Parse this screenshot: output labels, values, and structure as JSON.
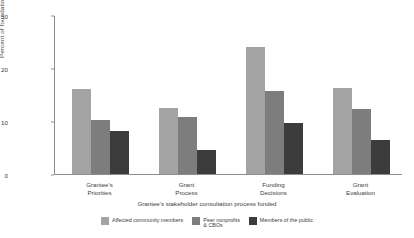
{
  "chart_data": {
    "type": "bar",
    "title": "",
    "subtitle": "",
    "xlabel": "Grantee's stakeholder consultation process funded",
    "ylabel": "Percent of foundations",
    "ylim": [
      0,
      30
    ],
    "yticks": [
      0,
      10,
      20,
      30
    ],
    "ytick_labels": [
      "0",
      "10",
      "20",
      "30"
    ],
    "grid": false,
    "legend_position": "bottom",
    "categories": [
      "Grantee's\nPriorities",
      "Grant\nProcess",
      "Funding\nDecisions",
      "Grant\nEvaluation"
    ],
    "category_lines": [
      [
        "Grantee's",
        "Priorities"
      ],
      [
        "Grant",
        "Process"
      ],
      [
        "Funding",
        "Decisions"
      ],
      [
        "Grant",
        "Evaluation"
      ]
    ],
    "series": [
      {
        "name": "Affected community members",
        "color": "#a3a3a3",
        "values": [
          16,
          12.5,
          24,
          16.2
        ]
      },
      {
        "name": "Peer nonprofits\n& CBOs",
        "color": "#7d7d7d",
        "values": [
          10.2,
          10.8,
          15.7,
          12.3
        ]
      },
      {
        "name": "Members of the public",
        "color": "#3c3c3c",
        "values": [
          8.2,
          4.6,
          9.7,
          6.4
        ]
      }
    ]
  },
  "colors": {
    "axis": "#8d8d8d",
    "text": "#3d3d3d",
    "background": "#ffffff"
  }
}
